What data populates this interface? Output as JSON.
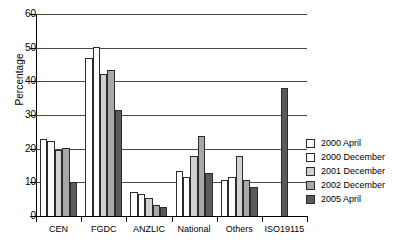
{
  "chart_data": {
    "type": "bar",
    "title": "",
    "xlabel": "",
    "ylabel": "Percentage",
    "ylim": [
      0,
      60
    ],
    "yticks": [
      0,
      10,
      20,
      30,
      40,
      50,
      60
    ],
    "grid": true,
    "legend_position": "right",
    "categories": [
      "CEN",
      "FGDC",
      "ANZLIC",
      "National",
      "Others",
      "ISO19115"
    ],
    "series": [
      {
        "name": "2000 April",
        "color": "#ffffff",
        "values": [
          23.0,
          47.0,
          7.2,
          13.5,
          10.6,
          0
        ]
      },
      {
        "name": "2000 December",
        "color": "#fbfbfb",
        "values": [
          22.3,
          50.2,
          6.5,
          11.5,
          11.5,
          0
        ]
      },
      {
        "name": "2001 December",
        "color": "#d0d0d0",
        "values": [
          19.5,
          42.3,
          5.4,
          17.8,
          17.8,
          0
        ]
      },
      {
        "name": "2002 December",
        "color": "#a8a8a8",
        "values": [
          20.3,
          43.5,
          3.3,
          23.8,
          10.6,
          0
        ]
      },
      {
        "name": "2005 April",
        "color": "#5a5a5a",
        "values": [
          10.0,
          31.5,
          2.6,
          12.7,
          8.7,
          38.0
        ]
      }
    ]
  },
  "axis": {
    "y_title": "Percentage",
    "y_tick_labels": [
      "0",
      "10",
      "20",
      "30",
      "40",
      "50",
      "60"
    ],
    "x_tick_labels": [
      "CEN",
      "FGDC",
      "ANZLIC",
      "National",
      "Others",
      "ISO19115"
    ]
  },
  "legend": {
    "items": [
      {
        "label": "2000 April",
        "color": "#ffffff"
      },
      {
        "label": "2000 December",
        "color": "#fbfbfb"
      },
      {
        "label": "2001 December",
        "color": "#d0d0d0"
      },
      {
        "label": "2002 December",
        "color": "#a8a8a8"
      },
      {
        "label": "2005 April",
        "color": "#5a5a5a"
      }
    ]
  }
}
